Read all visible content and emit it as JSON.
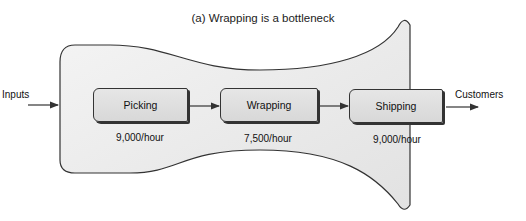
{
  "title": "(a) Wrapping is a bottleneck",
  "input_label": "Inputs",
  "output_label": "Customers",
  "stages": [
    {
      "name": "Picking",
      "rate": "9,000/hour"
    },
    {
      "name": "Wrapping",
      "rate": "7,500/hour"
    },
    {
      "name": "Shipping",
      "rate": "9,000/hour"
    }
  ],
  "colors": {
    "funnel_fill": "#e8e8e8",
    "outline": "#333333",
    "box_fill": "#dcdcdc"
  }
}
